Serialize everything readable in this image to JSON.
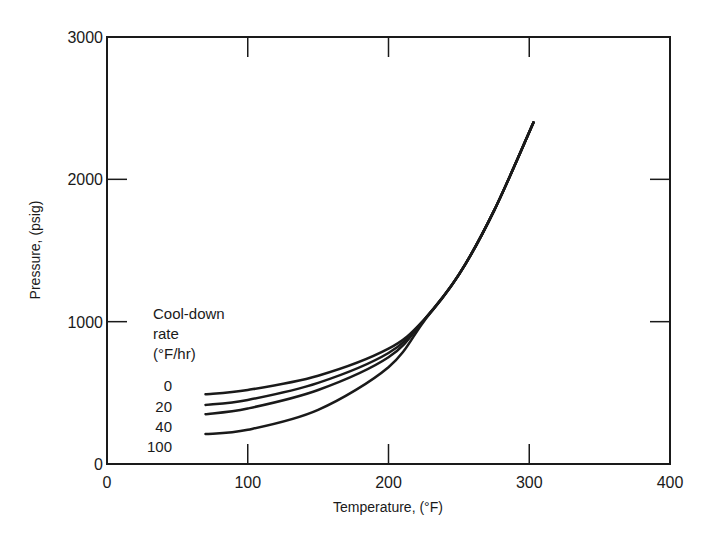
{
  "chart_data": {
    "type": "line",
    "title": "",
    "xlabel": "Temperature, (°F)",
    "ylabel": "Pressure, (psig)",
    "xlim": [
      0,
      400
    ],
    "ylim": [
      0,
      3000
    ],
    "x_ticks": [
      "0",
      "100",
      "200",
      "300",
      "400"
    ],
    "y_ticks": [
      "0",
      "1000",
      "2000",
      "3000"
    ],
    "grid": false,
    "legend": {
      "title_lines": [
        "Cool-down",
        "rate",
        "(°F/hr)"
      ],
      "entries": [
        "0",
        "20",
        "40",
        "100"
      ],
      "position": "inline-left"
    },
    "series": [
      {
        "name": "0",
        "x": [
          70,
          100,
          150,
          200,
          225,
          250,
          275,
          303
        ],
        "y": [
          490,
          520,
          620,
          810,
          1010,
          1330,
          1780,
          2400
        ]
      },
      {
        "name": "20",
        "x": [
          70,
          100,
          150,
          200,
          225,
          250,
          275,
          303
        ],
        "y": [
          415,
          450,
          570,
          780,
          1010,
          1330,
          1780,
          2400
        ]
      },
      {
        "name": "40",
        "x": [
          70,
          100,
          150,
          200,
          225,
          250,
          275,
          303
        ],
        "y": [
          350,
          390,
          520,
          750,
          1010,
          1330,
          1780,
          2400
        ]
      },
      {
        "name": "100",
        "x": [
          70,
          100,
          150,
          200,
          225,
          250,
          275,
          303
        ],
        "y": [
          210,
          240,
          380,
          680,
          1000,
          1330,
          1780,
          2400
        ]
      }
    ]
  }
}
